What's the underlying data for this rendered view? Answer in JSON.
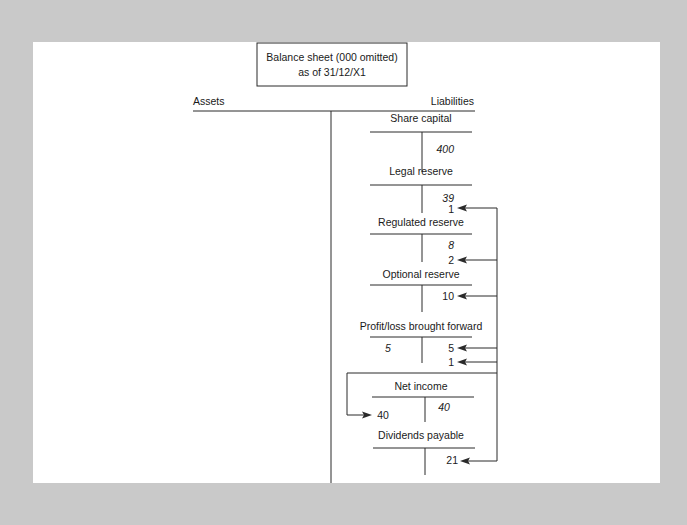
{
  "title_box": {
    "line1": "Balance sheet (000 omitted)",
    "line2": "as of 31/12/X1"
  },
  "headers": {
    "left": "Assets",
    "right": "Liabilities"
  },
  "accounts": [
    {
      "name": "Share capital",
      "debit": [],
      "credit": [
        {
          "value": "400",
          "italic": true
        }
      ]
    },
    {
      "name": "Legal reserve",
      "debit": [],
      "credit": [
        {
          "value": "39",
          "italic": true
        },
        {
          "value": "1",
          "italic": false,
          "arrow": true
        }
      ]
    },
    {
      "name": "Regulated reserve",
      "debit": [],
      "credit": [
        {
          "value": "8",
          "italic": true
        },
        {
          "value": "2",
          "italic": false,
          "arrow": true
        }
      ]
    },
    {
      "name": "Optional reserve",
      "debit": [],
      "credit": [
        {
          "value": "10",
          "italic": false,
          "arrow": true
        }
      ]
    },
    {
      "name": "Profit/loss brought forward",
      "debit": [
        {
          "value": "5",
          "italic": true
        }
      ],
      "credit": [
        {
          "value": "5",
          "italic": false,
          "arrow": true
        },
        {
          "value": "1",
          "italic": false,
          "arrow": true
        }
      ]
    },
    {
      "name": "Net income",
      "debit": [
        {
          "value": "40",
          "italic": false,
          "arrow_in": true
        }
      ],
      "credit": [
        {
          "value": "40",
          "italic": true
        }
      ]
    },
    {
      "name": "Dividends payable",
      "debit": [],
      "credit": [
        {
          "value": "21",
          "italic": false,
          "arrow": true
        }
      ]
    }
  ]
}
